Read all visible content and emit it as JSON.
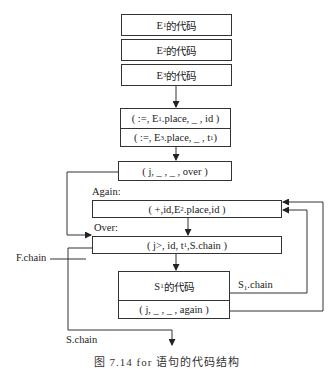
{
  "diagram": {
    "blocks": {
      "e1_code": {
        "prefix": "E",
        "sub": "1",
        "suffix": "的代码"
      },
      "e2_code": {
        "prefix": "E",
        "sub": "2",
        "suffix": "的代码"
      },
      "e3_code": {
        "prefix": "E",
        "sub": "3",
        "suffix": "的代码"
      },
      "assign1": {
        "pre": "( :=, E",
        "sub": "1",
        "post": ".place, _ , id )"
      },
      "assign2": {
        "pre": "( :=, E",
        "sub": "3",
        "post": ".place, _ , t",
        "sub2": "1",
        "post2": " )"
      },
      "jump_over": {
        "text": "( j, _ , _ , over )"
      },
      "again_stmt": {
        "pre": "( +,id,E",
        "sub": "2",
        "post": ".place,id )"
      },
      "over_stmt": {
        "pre": "( j>, id, t",
        "sub": "1",
        "post": ",S.chain )"
      },
      "s1_code": {
        "prefix": "S",
        "sub": "1",
        "suffix": "的代码"
      },
      "jump_again": {
        "text": "( j, _ , _ , again )"
      }
    },
    "labels": {
      "again": "Again:",
      "over": "Over:",
      "f_chain": "F.chain",
      "s_chain": "S.chain",
      "s1_chain_prefix": "S",
      "s1_chain_sub": "1",
      "s1_chain_suffix": ".chain"
    },
    "caption": "图 7.14   for 语句的代码结构"
  }
}
